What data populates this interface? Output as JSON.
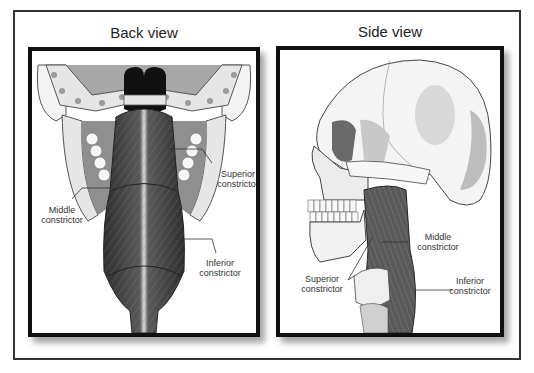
{
  "figure": {
    "panels": [
      {
        "title": "Back view",
        "labels": [
          {
            "line1": "Superior",
            "line2": "constrictor"
          },
          {
            "line1": "Middle",
            "line2": "constrictor"
          },
          {
            "line1": "Inferior",
            "line2": "constrictor"
          }
        ]
      },
      {
        "title": "Side view",
        "labels": [
          {
            "line1": "Middle",
            "line2": "constrictor"
          },
          {
            "line1": "Superior",
            "line2": "constrictor"
          },
          {
            "line1": "Inferior",
            "line2": "constrictor"
          }
        ]
      }
    ]
  },
  "colors": {
    "frame": "#333333",
    "panel_border": "#111111",
    "muscle_dark": "#3a3a3a",
    "muscle_mid": "#6a6a6a",
    "bone": "#f2f2f2",
    "bone_shade": "#bdbdbd"
  }
}
